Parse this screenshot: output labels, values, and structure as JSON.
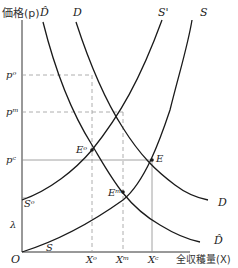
{
  "axes": {
    "y_label": "価格(p)",
    "x_label": "全収穫量(X)",
    "origin": "O"
  },
  "curves": {
    "D_hat_top": "D̂",
    "D_top": "D",
    "S_prime_top": "S'",
    "S_top": "S",
    "D_right": "D",
    "D_hat_right": "D̂",
    "S_bottom": "S",
    "S_o_left": "Sᵒ"
  },
  "price_labels": {
    "p_o": "pᵒ",
    "p_m": "pᵐ",
    "p_c": "pᶜ",
    "lambda": "λ"
  },
  "points": {
    "E_o": "Eᵒ",
    "E_m": "Eᵐ",
    "E": "E"
  },
  "quantity_labels": {
    "X_o": "Xᵒ",
    "X_m": "Xᵐ",
    "X_c": "Xᶜ"
  },
  "colors": {
    "curve": "#1a1a1a",
    "axis": "#333333",
    "dashed": "#9a9a9a",
    "solid_guide": "#8a8a8a"
  }
}
